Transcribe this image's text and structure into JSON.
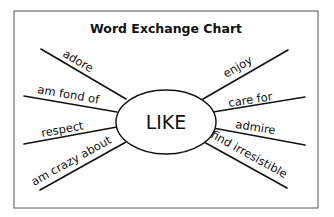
{
  "title": "Word Exchange Chart",
  "center_word": "LIKE",
  "colors": {
    "ink": "#111111",
    "frame": "#555555",
    "background": "#ffffff"
  },
  "left_words": [
    {
      "id": "adore",
      "label": "adore"
    },
    {
      "id": "am-fond-of",
      "label": "am fond of"
    },
    {
      "id": "respect",
      "label": "respect"
    },
    {
      "id": "am-crazy-about",
      "label": "am crazy about"
    }
  ],
  "right_words": [
    {
      "id": "enjoy",
      "label": "enjoy"
    },
    {
      "id": "care-for",
      "label": "care for"
    },
    {
      "id": "admire",
      "label": "admire"
    },
    {
      "id": "find-irresistible",
      "label": "find irresistible"
    }
  ]
}
